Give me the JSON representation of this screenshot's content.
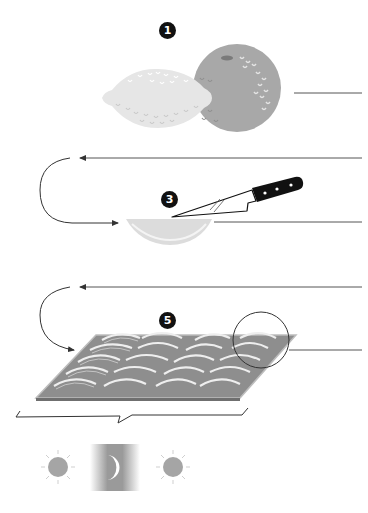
{
  "diagram": {
    "steps": [
      {
        "number": "1",
        "label": "citrus fruits (lemon and orange)"
      },
      {
        "number": "3",
        "label": "slice fruit with knife"
      },
      {
        "number": "5",
        "label": "arrange slices on tray"
      }
    ],
    "cycle": [
      {
        "icon": "sun-icon",
        "label": "day"
      },
      {
        "icon": "moon-icon",
        "label": "night"
      },
      {
        "icon": "sun-icon",
        "label": "day"
      }
    ],
    "colors": {
      "lemon": "#e6e6e6",
      "orange": "#a8a8a8",
      "slice": "#dcdcdc",
      "tray": "#8e8e8e",
      "tray_rim": "#bdbdbd",
      "lines": "#555555",
      "badge": "#111111",
      "sun": "#a5a5a5"
    }
  }
}
